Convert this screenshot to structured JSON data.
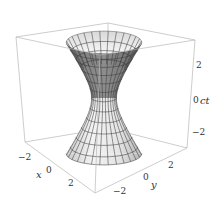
{
  "chart_data": {
    "type": "surface3d",
    "title": "",
    "xlabel": "x",
    "ylabel": "y",
    "zlabel": "ct",
    "x_ticks": [
      "-2",
      "0",
      "2"
    ],
    "y_ticks": [
      "-2",
      "0",
      "2"
    ],
    "z_ticks": [
      "2",
      "0",
      "-2"
    ],
    "xlim": [
      -3,
      3
    ],
    "ylim": [
      -3,
      3
    ],
    "zlim": [
      -3,
      3
    ],
    "surface": {
      "equation": "x^2 + y^2 - (ct)^2 = 1",
      "waist_radius": 1,
      "mesh_lines": true,
      "color": "#e6e6e6",
      "shade_dark": "#6e6e6e"
    },
    "box": true,
    "grid": false,
    "legend": null
  },
  "labels": {
    "x": "x",
    "y": "y",
    "z": "ct",
    "x_ticks": [
      "−2",
      "0",
      "2"
    ],
    "y_ticks": [
      "−2",
      "0",
      "2"
    ],
    "z_ticks": [
      "2",
      "0",
      "−2"
    ]
  }
}
